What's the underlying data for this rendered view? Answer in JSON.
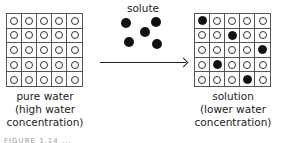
{
  "left_panel": {
    "label_lines": [
      "pure water",
      "(high water",
      "concentration)"
    ],
    "grid": {
      "rows": 5,
      "cols": 5,
      "cells": [
        "w",
        "w",
        "w",
        "w",
        "w",
        "w",
        "w",
        "w",
        "w",
        "w",
        "w",
        "w",
        "w",
        "w",
        "w",
        "w",
        "w",
        "w",
        "w",
        "w",
        "w",
        "w",
        "w",
        "w",
        "w"
      ]
    }
  },
  "middle": {
    "solute_label": "solute",
    "solute_count": 5
  },
  "right_panel": {
    "label_lines": [
      "solution",
      "(lower water",
      "concentration)"
    ],
    "grid": {
      "rows": 5,
      "cols": 5,
      "cells": [
        "s",
        "w",
        "w",
        "w",
        "w",
        "w",
        "w",
        "s",
        "w",
        "w",
        "w",
        "w",
        "w",
        "w",
        "s",
        "w",
        "s",
        "w",
        "w",
        "w",
        "w",
        "w",
        "w",
        "s",
        "w"
      ]
    }
  },
  "legend": {
    "w": "water molecule (open circle)",
    "s": "solute particle (filled circle)"
  },
  "caption": "FIGURE 1.14 ..."
}
